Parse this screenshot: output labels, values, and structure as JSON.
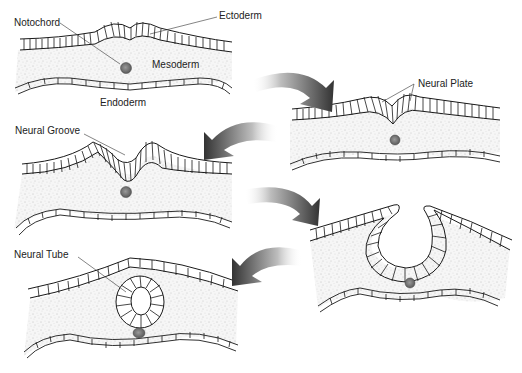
{
  "colors": {
    "line": "#1a1a1a",
    "tissue_fill": "#f4f4f4",
    "speckle": "#9a9a9a",
    "notochord": "#6e6e6e",
    "arrow_dark": "#3a3a3a",
    "arrow_light": "#ffffff"
  },
  "labels": {
    "notochord": "Notochord",
    "ectoderm": "Ectoderm",
    "mesoderm": "Mesoderm",
    "endoderm": "Endoderm",
    "neural_plate": "Neural Plate",
    "neural_groove": "Neural Groove",
    "neural_tube": "Neural Tube"
  },
  "stages": [
    {
      "id": 1,
      "name": "gastrula-layers",
      "position": "top-left"
    },
    {
      "id": 2,
      "name": "neural-plate",
      "position": "upper-right"
    },
    {
      "id": 3,
      "name": "neural-groove",
      "position": "middle-left"
    },
    {
      "id": 4,
      "name": "neural-folds-closing",
      "position": "lower-right"
    },
    {
      "id": 5,
      "name": "neural-tube",
      "position": "bottom-left"
    }
  ],
  "arrows": [
    {
      "from": 1,
      "to": 2,
      "direction": "right-curving-down"
    },
    {
      "from": 2,
      "to": 3,
      "direction": "left-curving-down"
    },
    {
      "from": 3,
      "to": 4,
      "direction": "right-curving-down"
    },
    {
      "from": 4,
      "to": 5,
      "direction": "left-curving-down"
    }
  ]
}
